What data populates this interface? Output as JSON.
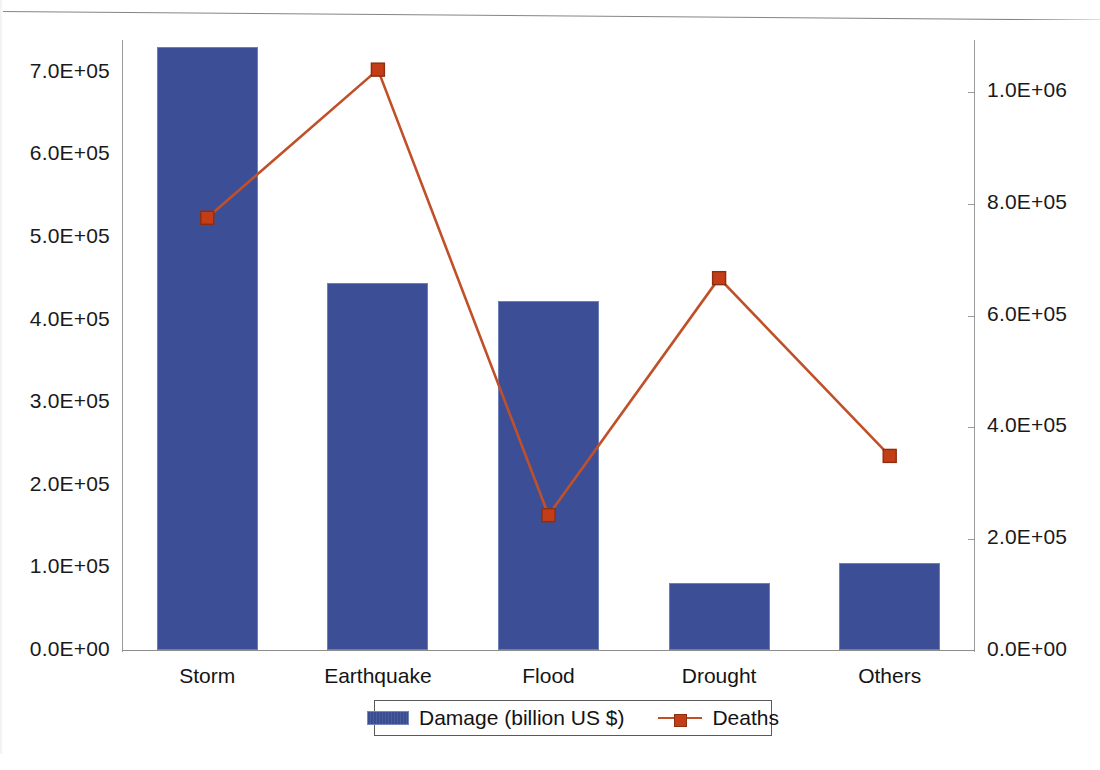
{
  "chart_data": {
    "type": "bar",
    "title": "",
    "subtitle": "",
    "xlabel": "",
    "categories": [
      "Storm",
      "Earthquake",
      "Flood",
      "Drought",
      "Others"
    ],
    "series": [
      {
        "name": "Damage (billion US $)",
        "type": "bar",
        "axis": "left",
        "color": "#3c4f96",
        "values": [
          730000,
          444000,
          422000,
          81000,
          105000
        ]
      },
      {
        "name": "Deaths",
        "type": "line",
        "axis": "right",
        "color": "#c0502a",
        "marker_color": "#c33d16",
        "values": [
          775000,
          1040000,
          243000,
          667000,
          349000
        ]
      }
    ],
    "left_axis": {
      "label": "",
      "ylim": [
        0,
        730000
      ],
      "tick_values": [
        0,
        100000,
        200000,
        300000,
        400000,
        500000,
        600000,
        700000
      ],
      "tick_labels": [
        "0.0E+00",
        "1.0E+05",
        "2.0E+05",
        "3.0E+05",
        "4.0E+05",
        "5.0E+05",
        "6.0E+05",
        "7.0E+05"
      ]
    },
    "right_axis": {
      "label": "",
      "ylim": [
        0,
        1093000
      ],
      "tick_values": [
        0,
        200000,
        400000,
        600000,
        800000,
        1000000
      ],
      "tick_labels": [
        "0.0E+00",
        "2.0E+05",
        "4.0E+05",
        "6.0E+05",
        "8.0E+05",
        "1.0E+06"
      ]
    },
    "grid": false,
    "legend_position": "bottom-center",
    "legend_entries": [
      "Damage (billion US $)",
      "Deaths"
    ]
  },
  "legend": {
    "damage_label": "Damage (billion US $)",
    "deaths_label": "Deaths"
  },
  "icons": {
    "bar_swatch": "bar-swatch-icon",
    "line_swatch": "line-marker-swatch-icon"
  }
}
